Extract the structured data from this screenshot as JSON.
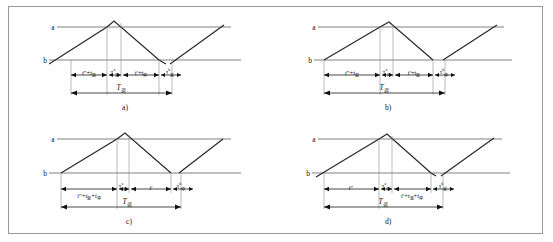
{
  "figure": {
    "caption_a": "a)",
    "caption_b": "b)",
    "caption_c": "c)",
    "caption_d": "d)",
    "level_high": "a",
    "level_low": "b",
    "period_label": "T",
    "period_sub": "调"
  },
  "panels": [
    {
      "id": "a",
      "caption": "a)",
      "segments": [
        {
          "text_html": "<i>t</i>″+<i>t</i><sub>驱</sub>"
        },
        {
          "text_html": "τ<sup>a</sup><sub>来</sub>"
        },
        {
          "text_html": "<i>t</i>′+<i>t</i><sub>停</sub>"
        },
        {
          "text_html": "τ<sup>b</sup><sub>来</sub>"
        }
      ],
      "period_html": "<i>T</i><sub>调</sub>"
    },
    {
      "id": "b",
      "caption": "b)",
      "segments": [
        {
          "text_html": "<i>t</i>″+<i>t</i><sub>驱</sub>"
        },
        {
          "text_html": "τ<sup>a</sup><sub>停</sub>"
        },
        {
          "text_html": "<i>t</i>′+<i>t</i><sub>驱</sub>"
        },
        {
          "text_html": "τ<sup>b</sup><sub>停</sub>"
        }
      ],
      "period_html": "<i>T</i><sub>调</sub>"
    },
    {
      "id": "c",
      "caption": "c)",
      "segments": [
        {
          "text_html": "<i>t</i>″+<i>t</i><sub>驱</sub>+<i>t</i><sub>停</sub>"
        },
        {
          "text_html": "τ<sup>a</sup><sub>来</sub>"
        },
        {
          "text_html": "<i>t</i>′"
        },
        {
          "text_html": "τ<sup>b</sup><sub>停</sub>"
        }
      ],
      "period_html": "<i>T</i><sub>调</sub>"
    },
    {
      "id": "d",
      "caption": "d)",
      "segments": [
        {
          "text_html": "<i>t</i>″"
        },
        {
          "text_html": "τ<sup>a</sup><sub>停</sub>"
        },
        {
          "text_html": "<i>t</i>′+<i>t</i><sub>驱</sub>+<i>t</i><sub>停</sub>"
        },
        {
          "text_html": "τ<sup>b</sup><sub>来</sub>"
        }
      ],
      "period_html": "<i>T</i><sub>调</sub>"
    }
  ]
}
